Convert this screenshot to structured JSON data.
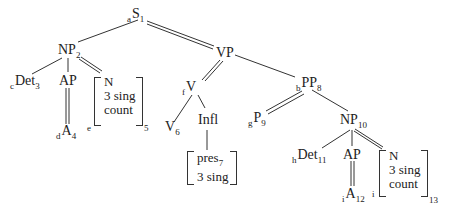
{
  "tree": {
    "nodes": {
      "S": {
        "pre": "a",
        "label": "S",
        "sub": "1"
      },
      "NP2": {
        "pre": "",
        "label": "NP",
        "sub": "2"
      },
      "VP": {
        "pre": "",
        "label": "VP",
        "sub": ""
      },
      "Det3": {
        "pre": "c",
        "label": "Det",
        "sub": "3"
      },
      "AP1": {
        "pre": "",
        "label": "AP",
        "sub": ""
      },
      "A4": {
        "pre": "d",
        "label": "A",
        "sub": "4"
      },
      "N5": {
        "pre": "e",
        "lines": [
          "N",
          "3 sing",
          "count"
        ],
        "sub": "5"
      },
      "V": {
        "pre": "f",
        "label": "V",
        "sub": ""
      },
      "V6": {
        "pre": "",
        "label": "V",
        "sub": "6"
      },
      "Infl": {
        "pre": "",
        "label": "Infl",
        "sub": ""
      },
      "pres7": {
        "lines": [
          "pres",
          "3 sing"
        ],
        "sub": "7"
      },
      "PP8": {
        "pre": "b",
        "label": "PP",
        "sub": "8"
      },
      "P9": {
        "pre": "g",
        "label": "P",
        "sub": "9"
      },
      "NP10": {
        "pre": "",
        "label": "NP",
        "sub": "10"
      },
      "Det11": {
        "pre": "h",
        "label": "Det",
        "sub": "11"
      },
      "AP2": {
        "pre": "",
        "label": "AP",
        "sub": ""
      },
      "A12": {
        "pre": "i",
        "label": "A",
        "sub": "12"
      },
      "N13": {
        "pre": "i",
        "lines": [
          "N",
          "3 sing",
          "count"
        ],
        "sub": "13"
      }
    }
  }
}
